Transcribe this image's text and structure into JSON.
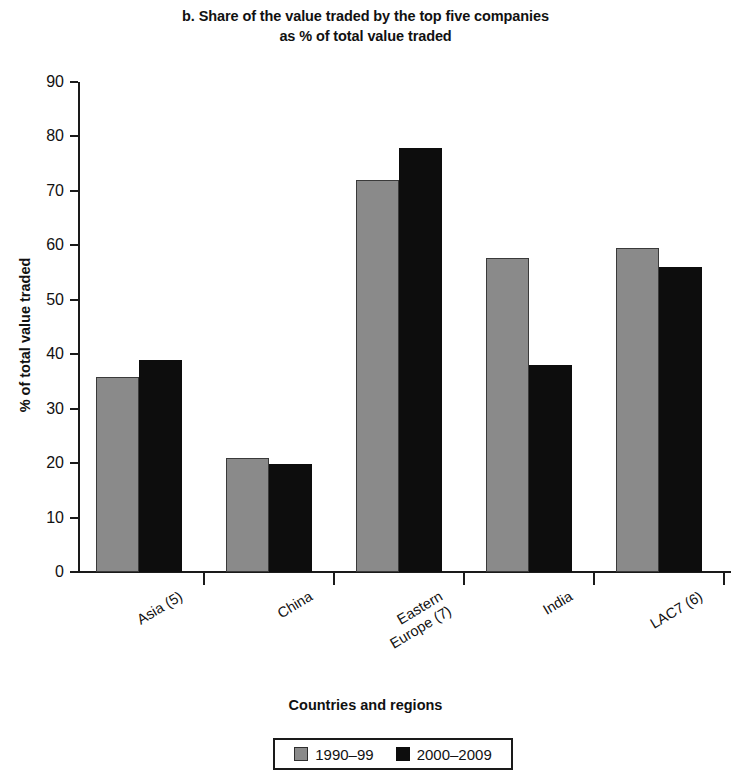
{
  "chart_data": {
    "type": "bar",
    "title": "b. Share of the value traded by the top five companies as % of total value traded",
    "title_line1": "b. Share of the value traded by the top five companies",
    "title_line2": "as % of total value traded",
    "xlabel": "Countries and regions",
    "ylabel": "% of total value traded",
    "ylim": [
      0,
      90
    ],
    "yticks": [
      0,
      10,
      20,
      30,
      40,
      50,
      60,
      70,
      80,
      90
    ],
    "ytick_labels": [
      "0",
      "10",
      "20",
      "30",
      "40",
      "50",
      "60",
      "70",
      "80",
      "90"
    ],
    "grid": false,
    "legend_position": "bottom",
    "categories": [
      "Asia (5)",
      "China",
      "Eastern\nEurope (7)",
      "India",
      "LAC7 (6)"
    ],
    "category_labels": [
      "Asia (5)",
      "China",
      "Eastern Europe (7)",
      "India",
      "LAC7 (6)"
    ],
    "series": [
      {
        "name": "1990–99",
        "color": "#8a8a8a",
        "values": [
          35.8,
          21.0,
          72.0,
          57.7,
          59.6
        ]
      },
      {
        "name": "2000–2009",
        "color": "#0d0d0d",
        "values": [
          39.0,
          19.8,
          77.9,
          38.0,
          56.0
        ]
      }
    ]
  },
  "legend": {
    "items": [
      {
        "label": "1990–99",
        "swatch": "series-1-swatch"
      },
      {
        "label": "2000–2009",
        "swatch": "series-2-swatch"
      }
    ]
  }
}
